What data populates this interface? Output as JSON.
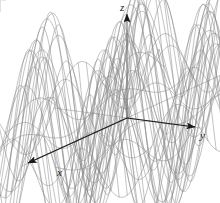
{
  "figure": {
    "type": "3d-surface-wireframe",
    "background_color": "#ffffff",
    "mesh_color": "#808080",
    "axis_color": "#1a1a1a",
    "width": 220,
    "height": 203
  },
  "axes": {
    "x": {
      "label": "x",
      "direction": "lower-left",
      "arrow": true
    },
    "y": {
      "label": "y",
      "direction": "lower-right",
      "arrow": true
    },
    "z": {
      "label": "z",
      "direction": "up",
      "arrow": true
    }
  },
  "chart_data": {
    "type": "surface",
    "title": "",
    "xlabel": "x",
    "ylabel": "y",
    "zlabel": "z",
    "surface_function": "z = sin(x) * sin(y)",
    "grid": true,
    "legend": false,
    "xlim": [
      -6.6,
      6.6
    ],
    "ylim": [
      -6.6,
      6.6
    ],
    "zlim": [
      -1,
      1
    ],
    "u_steps": 26,
    "v_steps": 26,
    "features": {
      "peaks_visible": 4,
      "valleys_visible": 3,
      "saddle_at_origin": true,
      "clipped_at_bottom_edge": true
    },
    "projection": {
      "origin_px": [
        127,
        118
      ],
      "x_axis_end_px": [
        22,
        166
      ],
      "y_axis_end_px": [
        200,
        128
      ],
      "z_axis_end_px": [
        127,
        8
      ],
      "elevation_deg": 22,
      "azimuth_deg": 36
    }
  }
}
